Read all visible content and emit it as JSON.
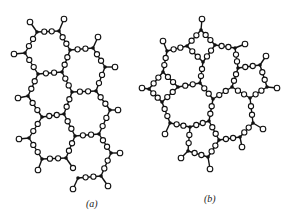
{
  "figure": {
    "colors": {
      "bond": "#111111",
      "network_former": "#111111",
      "oxygen_fill": "#ffffff"
    },
    "panels": [
      {
        "label": "(a)",
        "si": {
          "s1": [
            37,
            32
          ],
          "s2": [
            59,
            31
          ],
          "s3": [
            70,
            50
          ],
          "s4": [
            62,
            72
          ],
          "s5": [
            38,
            74
          ],
          "s6": [
            25,
            53
          ],
          "s7": [
            93,
            48
          ],
          "s8": [
            105,
            67
          ],
          "s9": [
            96,
            91
          ],
          "s10": [
            72,
            92
          ],
          "s11": [
            64,
            114
          ],
          "s12": [
            42,
            117
          ],
          "s13": [
            28,
            96
          ],
          "s14": [
            110,
            110
          ],
          "s15": [
            99,
            134
          ],
          "s16": [
            75,
            136
          ],
          "s17": [
            66,
            158
          ],
          "s18": [
            42,
            159
          ],
          "s19": [
            29,
            138
          ],
          "s20": [
            111,
            153
          ],
          "s21": [
            101,
            176
          ],
          "s22": [
            78,
            178
          ]
        },
        "bonds": [
          [
            "s1",
            "s2"
          ],
          [
            "s2",
            "s3"
          ],
          [
            "s3",
            "s4"
          ],
          [
            "s4",
            "s5"
          ],
          [
            "s5",
            "s6"
          ],
          [
            "s6",
            "s1"
          ],
          [
            "s3",
            "s7"
          ],
          [
            "s7",
            "s8"
          ],
          [
            "s8",
            "s9"
          ],
          [
            "s9",
            "s10"
          ],
          [
            "s10",
            "s4"
          ],
          [
            "s10",
            "s11"
          ],
          [
            "s11",
            "s12"
          ],
          [
            "s12",
            "s13"
          ],
          [
            "s13",
            "s5"
          ],
          [
            "s9",
            "s14"
          ],
          [
            "s14",
            "s15"
          ],
          [
            "s15",
            "s16"
          ],
          [
            "s16",
            "s11"
          ],
          [
            "s16",
            "s17"
          ],
          [
            "s17",
            "s18"
          ],
          [
            "s18",
            "s19"
          ],
          [
            "s19",
            "s12"
          ],
          [
            "s15",
            "s20"
          ],
          [
            "s20",
            "s21"
          ],
          [
            "s21",
            "s22"
          ]
        ],
        "broken_bonds": [
          {
            "from": "s17",
            "to": "s22",
            "o": [
              73,
              168
            ]
          }
        ],
        "terminals": [
          [
            "s1",
            [
              30,
              22
            ]
          ],
          [
            "s2",
            [
              64,
              19
            ]
          ],
          [
            "s6",
            [
              14,
              54
            ]
          ],
          [
            "s7",
            [
              98,
              37
            ]
          ],
          [
            "s8",
            [
              115,
              67
            ]
          ],
          [
            "s13",
            [
              18,
              98
            ]
          ],
          [
            "s14",
            [
              118,
              110
            ]
          ],
          [
            "s19",
            [
              19,
              139
            ]
          ],
          [
            "s20",
            [
              120,
              153
            ]
          ],
          [
            "s18",
            [
              38,
              170
            ]
          ],
          [
            "s22",
            [
              73,
              189
            ]
          ],
          [
            "s21",
            [
              108,
              186
            ]
          ]
        ]
      },
      {
        "label": "(b)",
        "si": {
          "A": [
            201,
            30
          ],
          "B": [
            187,
            46
          ],
          "C": [
            215,
            45
          ],
          "D": [
            203,
            62
          ],
          "E": [
            167,
            51
          ],
          "F": [
            235,
            48
          ],
          "G": [
            163,
            72
          ],
          "H": [
            178,
            87
          ],
          "I": [
            200,
            83
          ],
          "J": [
            149,
            89
          ],
          "K": [
            162,
            102
          ],
          "L": [
            238,
            68
          ],
          "M": [
            260,
            65
          ],
          "N": [
            232,
            87
          ],
          "O2": [
            267,
            87
          ],
          "P": [
            213,
            99
          ],
          "Q": [
            250,
            98
          ],
          "R": [
            170,
            123
          ],
          "S": [
            190,
            127
          ],
          "T": [
            209,
            121
          ],
          "U": [
            253,
            123
          ],
          "V": [
            219,
            140
          ],
          "W": [
            240,
            137
          ],
          "X": [
            188,
            151
          ],
          "Y": [
            208,
            157
          ]
        },
        "bonds": [
          [
            "A",
            "B"
          ],
          [
            "A",
            "C"
          ],
          [
            "B",
            "D"
          ],
          [
            "C",
            "D"
          ],
          [
            "C",
            "F"
          ],
          [
            "B",
            "E"
          ],
          [
            "E",
            "G"
          ],
          [
            "D",
            "I"
          ],
          [
            "G",
            "H"
          ],
          [
            "H",
            "I"
          ],
          [
            "G",
            "J"
          ],
          [
            "J",
            "K"
          ],
          [
            "K",
            "H"
          ],
          [
            "F",
            "L"
          ],
          [
            "L",
            "M"
          ],
          [
            "L",
            "N"
          ],
          [
            "M",
            "O2"
          ],
          [
            "O2",
            "Q"
          ],
          [
            "N",
            "Q"
          ],
          [
            "I",
            "P"
          ],
          [
            "P",
            "N"
          ],
          [
            "K",
            "R"
          ],
          [
            "R",
            "S"
          ],
          [
            "S",
            "T"
          ],
          [
            "T",
            "P"
          ],
          [
            "Q",
            "U"
          ],
          [
            "U",
            "W"
          ],
          [
            "W",
            "V"
          ],
          [
            "T",
            "V"
          ],
          [
            "S",
            "X"
          ],
          [
            "X",
            "Y"
          ],
          [
            "Y",
            "V"
          ]
        ],
        "terminals": [
          [
            "A",
            [
              202,
              19
            ]
          ],
          [
            "E",
            [
              163,
              41
            ]
          ],
          [
            "F",
            [
              245,
              44
            ]
          ],
          [
            "J",
            [
              142,
              88
            ]
          ],
          [
            "M",
            [
              266,
              56
            ]
          ],
          [
            "O2",
            [
              277,
              88
            ]
          ],
          [
            "R",
            [
              165,
              134
            ]
          ],
          [
            "U",
            [
              263,
              129
            ]
          ],
          [
            "W",
            [
              242,
              147
            ]
          ],
          [
            "X",
            [
              181,
              158
            ]
          ],
          [
            "Y",
            [
              210,
              169
            ]
          ]
        ]
      }
    ]
  }
}
